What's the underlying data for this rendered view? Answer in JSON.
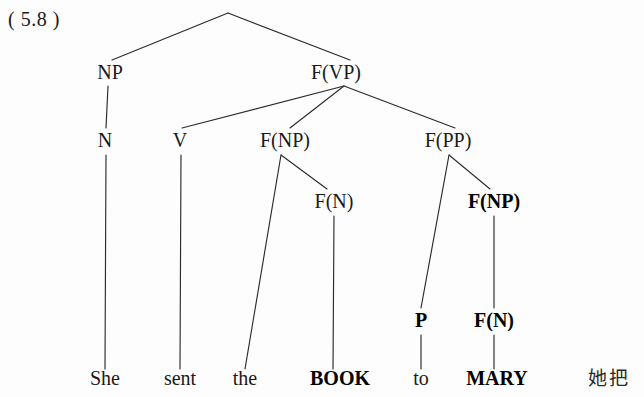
{
  "figure": {
    "example_number": "( 5.8 )",
    "background_color": "#fdfdfd",
    "line_color": "#2b2b2b",
    "text_color": "#1a1a1a"
  },
  "gloss": {
    "cjk_text": "她把"
  },
  "tree": {
    "nodes": [
      {
        "id": "root",
        "label": "",
        "x": 228,
        "y": 13,
        "bold": false,
        "visible": false
      },
      {
        "id": "np",
        "label": "NP",
        "x": 110,
        "y": 79,
        "bold": false,
        "visible": true
      },
      {
        "id": "fvp",
        "label": "F(VP)",
        "x": 336,
        "y": 79,
        "bold": false,
        "visible": true
      },
      {
        "id": "n",
        "label": "N",
        "x": 105,
        "y": 147,
        "bold": false,
        "visible": true
      },
      {
        "id": "v",
        "label": "V",
        "x": 180,
        "y": 147,
        "bold": false,
        "visible": true
      },
      {
        "id": "fnp-obj",
        "label": "F(NP)",
        "x": 285,
        "y": 147,
        "bold": false,
        "visible": true
      },
      {
        "id": "fpp",
        "label": "F(PP)",
        "x": 448,
        "y": 147,
        "bold": false,
        "visible": true
      },
      {
        "id": "fn-book",
        "label": "F(N)",
        "x": 334,
        "y": 208,
        "bold": false,
        "visible": true
      },
      {
        "id": "fnp-mary",
        "label": "F(NP)",
        "x": 494,
        "y": 208,
        "bold": true,
        "visible": true
      },
      {
        "id": "p",
        "label": "P",
        "x": 421,
        "y": 327,
        "bold": true,
        "visible": true
      },
      {
        "id": "fn-mary",
        "label": "F(N)",
        "x": 494,
        "y": 327,
        "bold": true,
        "visible": true
      }
    ],
    "leaves": [
      {
        "id": "leaf-she",
        "label": "She",
        "x": 105,
        "y": 385,
        "bold": false
      },
      {
        "id": "leaf-sent",
        "label": "sent",
        "x": 180,
        "y": 385,
        "bold": false
      },
      {
        "id": "leaf-the",
        "label": "the",
        "x": 245,
        "y": 385,
        "bold": false
      },
      {
        "id": "leaf-book",
        "label": "BOOK",
        "x": 340,
        "y": 385,
        "bold": true
      },
      {
        "id": "leaf-to",
        "label": "to",
        "x": 421,
        "y": 385,
        "bold": false
      },
      {
        "id": "leaf-mary",
        "label": "MARY",
        "x": 497,
        "y": 385,
        "bold": true
      }
    ],
    "edges": [
      {
        "id": "e-root-np",
        "from": "root",
        "to": "np",
        "x1": 228,
        "y1": 13,
        "x2": 112,
        "y2": 60
      },
      {
        "id": "e-root-fvp",
        "from": "root",
        "to": "fvp",
        "x1": 228,
        "y1": 13,
        "x2": 350,
        "y2": 60
      },
      {
        "id": "e-np-n",
        "from": "np",
        "to": "n",
        "x1": 108,
        "y1": 86,
        "x2": 106,
        "y2": 128
      },
      {
        "id": "e-fvp-v",
        "from": "fvp",
        "to": "v",
        "x1": 344,
        "y1": 86,
        "x2": 182,
        "y2": 128
      },
      {
        "id": "e-fvp-fnp",
        "from": "fvp",
        "to": "fnp-obj",
        "x1": 344,
        "y1": 86,
        "x2": 290,
        "y2": 128
      },
      {
        "id": "e-fvp-fpp",
        "from": "fvp",
        "to": "fpp",
        "x1": 344,
        "y1": 86,
        "x2": 455,
        "y2": 128
      },
      {
        "id": "e-n-she",
        "from": "n",
        "to": "leaf-she",
        "x1": 106,
        "y1": 155,
        "x2": 105,
        "y2": 369
      },
      {
        "id": "e-v-sent",
        "from": "v",
        "to": "leaf-sent",
        "x1": 181,
        "y1": 155,
        "x2": 180,
        "y2": 369
      },
      {
        "id": "e-fnp-the",
        "from": "fnp-obj",
        "to": "leaf-the",
        "x1": 281,
        "y1": 155,
        "x2": 245,
        "y2": 369
      },
      {
        "id": "e-fnp-fn",
        "from": "fnp-obj",
        "to": "fn-book",
        "x1": 281,
        "y1": 155,
        "x2": 327,
        "y2": 189
      },
      {
        "id": "e-fn-book",
        "from": "fn-book",
        "to": "leaf-book",
        "x1": 334,
        "y1": 216,
        "x2": 333,
        "y2": 369
      },
      {
        "id": "e-fpp-p",
        "from": "fpp",
        "to": "p",
        "x1": 449,
        "y1": 155,
        "x2": 421,
        "y2": 308
      },
      {
        "id": "e-fpp-fnp",
        "from": "fpp",
        "to": "fnp-mary",
        "x1": 449,
        "y1": 155,
        "x2": 490,
        "y2": 189
      },
      {
        "id": "e-fnpmary-fn",
        "from": "fnp-mary",
        "to": "fn-mary",
        "x1": 494,
        "y1": 216,
        "x2": 494,
        "y2": 308
      },
      {
        "id": "e-p-to",
        "from": "p",
        "to": "leaf-to",
        "x1": 421,
        "y1": 335,
        "x2": 421,
        "y2": 369
      },
      {
        "id": "e-fnmary-mary",
        "from": "fn-mary",
        "to": "leaf-mary",
        "x1": 494,
        "y1": 335,
        "x2": 494,
        "y2": 369
      }
    ]
  }
}
